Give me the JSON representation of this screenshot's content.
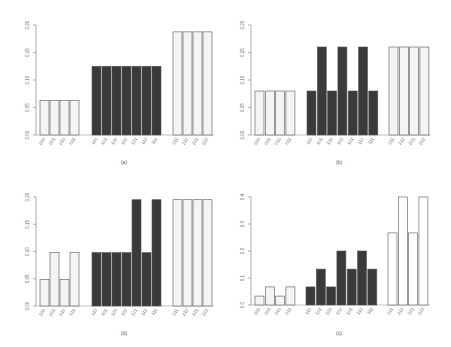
{
  "chart_data": [
    {
      "type": "bar",
      "panel": "(a)",
      "categories": [
        "000",
        "001",
        "010",
        "011",
        "110",
        "101",
        "120",
        "102",
        "121",
        "112",
        "111",
        "211",
        "212",
        "221",
        "222"
      ],
      "groups": [
        {
          "name": "group-0",
          "fill": "#f4f4f4",
          "indices": [
            0,
            1,
            2,
            3
          ]
        },
        {
          "name": "group-1",
          "fill": "#3a3a3a",
          "indices": [
            4,
            5,
            6,
            7,
            8,
            9,
            10
          ]
        },
        {
          "name": "group-2",
          "fill": "#f4f4f4",
          "indices": [
            11,
            12,
            13,
            14
          ]
        }
      ],
      "values": [
        0.0625,
        0.0625,
        0.0625,
        0.0625,
        0.125,
        0.125,
        0.125,
        0.125,
        0.125,
        0.125,
        0.125,
        0.1875,
        0.1875,
        0.1875,
        0.1875
      ],
      "yticks": [
        "0.00",
        "0.05",
        "0.10",
        "0.15",
        "0.20"
      ],
      "ylim": [
        0,
        0.2
      ],
      "title": "",
      "xlabel": "",
      "ylabel": "",
      "caption": "(a)",
      "grid": false,
      "legend": null
    },
    {
      "type": "bar",
      "panel": "(b)",
      "categories": [
        "000",
        "001",
        "010",
        "011",
        "110",
        "101",
        "120",
        "102",
        "121",
        "112",
        "111",
        "211",
        "212",
        "221",
        "222"
      ],
      "groups": [
        {
          "name": "group-0",
          "fill": "#f4f4f4",
          "indices": [
            0,
            1,
            2,
            3
          ]
        },
        {
          "name": "group-1",
          "fill": "#3a3a3a",
          "indices": [
            4,
            5,
            6,
            7,
            8,
            9,
            10
          ]
        },
        {
          "name": "group-2",
          "fill": "#f4f4f4",
          "indices": [
            11,
            12,
            13,
            14
          ]
        }
      ],
      "values": [
        0.08,
        0.08,
        0.08,
        0.08,
        0.08,
        0.16,
        0.08,
        0.16,
        0.08,
        0.16,
        0.08,
        0.16,
        0.16,
        0.16,
        0.16
      ],
      "yticks": [
        "0.00",
        "0.05",
        "0.10",
        "0.15",
        "0.20"
      ],
      "ylim": [
        0,
        0.2
      ],
      "title": "",
      "xlabel": "",
      "ylabel": "",
      "caption": "(b)",
      "grid": false,
      "legend": null
    },
    {
      "type": "bar",
      "panel": "(d)",
      "categories": [
        "000",
        "001",
        "010",
        "011",
        "110",
        "101",
        "120",
        "102",
        "121",
        "112",
        "111",
        "211",
        "212",
        "221",
        "222"
      ],
      "groups": [
        {
          "name": "group-0",
          "fill": "#f4f4f4",
          "indices": [
            0,
            1,
            2,
            3
          ]
        },
        {
          "name": "group-1",
          "fill": "#3a3a3a",
          "indices": [
            4,
            5,
            6,
            7,
            8,
            9,
            10
          ]
        },
        {
          "name": "group-2",
          "fill": "#f4f4f4",
          "indices": [
            11,
            12,
            13,
            14
          ]
        }
      ],
      "values": [
        0.049,
        0.098,
        0.049,
        0.098,
        0.098,
        0.098,
        0.098,
        0.098,
        0.195,
        0.098,
        0.195,
        0.195,
        0.195,
        0.195,
        0.195
      ],
      "yticks": [
        "0.00",
        "0.05",
        "0.10",
        "0.15",
        "0.20"
      ],
      "ylim": [
        0,
        0.2
      ],
      "title": "",
      "xlabel": "",
      "ylabel": "",
      "caption": "(d)",
      "grid": false,
      "legend": null
    },
    {
      "type": "bar",
      "panel": "(c)",
      "categories": [
        "000",
        "001",
        "010",
        "011",
        "110",
        "101",
        "120",
        "102",
        "121",
        "112",
        "111",
        "211",
        "212",
        "221",
        "222"
      ],
      "groups": [
        {
          "name": "group-0",
          "fill": "#f4f4f4",
          "indices": [
            0,
            1,
            2,
            3
          ]
        },
        {
          "name": "group-1",
          "fill": "#3a3a3a",
          "indices": [
            4,
            5,
            6,
            7,
            8,
            9,
            10
          ]
        },
        {
          "name": "group-2",
          "fill": "#ffffff",
          "indices": [
            11,
            12,
            13,
            14
          ]
        }
      ],
      "values": [
        0.033,
        0.067,
        0.033,
        0.067,
        0.067,
        0.133,
        0.067,
        0.2,
        0.133,
        0.2,
        0.133,
        0.267,
        0.4,
        0.267,
        0.4
      ],
      "yticks": [
        "0.0",
        "0.1",
        "0.2",
        "0.3",
        "0.4"
      ],
      "ylim": [
        0,
        0.4
      ],
      "title": "",
      "xlabel": "",
      "ylabel": "",
      "caption": "(c)",
      "grid": false,
      "legend": null
    }
  ],
  "panels": {
    "a": {
      "caption": "(a)"
    },
    "b": {
      "caption": "(b)"
    },
    "d": {
      "caption": "(d)"
    },
    "c": {
      "caption": "(c)"
    }
  }
}
